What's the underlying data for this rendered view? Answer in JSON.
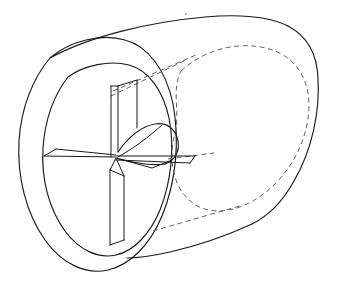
{
  "figure": {
    "title": "Hollow cylinder with internal radial vanes",
    "projection": "oblique",
    "canvas": {
      "width": 345,
      "height": 283,
      "background": "#ffffff"
    },
    "line_styles": {
      "visible_edge": {
        "color": "#1a1a1a",
        "width": 1.15,
        "pattern": "solid"
      },
      "hidden_edge": {
        "color": "#5c5c5c",
        "width": 0.95,
        "pattern": "dashed",
        "dash": "5 3.5"
      }
    },
    "parts": [
      {
        "id": "outer-shell",
        "label": "Cylinder outer shell",
        "visible": true
      },
      {
        "id": "front-face-outer-circle",
        "label": "Front face outer circle",
        "visible": true
      },
      {
        "id": "front-face-inner-circle",
        "label": "Front face inner bore circle",
        "visible": true
      },
      {
        "id": "far-bore-circle",
        "label": "Far end inner bore (hidden)",
        "visible": false
      },
      {
        "id": "vane-upper-vertical",
        "label": "Upper vertical vane",
        "visible": true
      },
      {
        "id": "vane-lower-vertical",
        "label": "Lower vertical vane",
        "visible": true
      },
      {
        "id": "vane-left-horizontal",
        "label": "Left horizontal vane",
        "visible": true
      },
      {
        "id": "vane-right-horizontal",
        "label": "Right horizontal vane",
        "visible": true
      },
      {
        "id": "vane-curved-scoop",
        "label": "Curved scoop vane",
        "visible": true
      },
      {
        "id": "hub",
        "label": "Central hub junction",
        "visible": true
      }
    ],
    "geometry": {
      "front_outer_circle": {
        "cx": 104,
        "cy": 148,
        "rx": 85,
        "ry": 122,
        "rotation": -28
      },
      "front_inner_circle": {
        "cx": 112,
        "cy": 151,
        "rx": 66,
        "ry": 97,
        "rotation": -28
      },
      "far_bore_circle": {
        "cx": 238,
        "cy": 128,
        "rx": 66,
        "ry": 97,
        "rotation": -28
      },
      "hub_point": {
        "x": 116,
        "y": 157
      },
      "axis_direction": {
        "dx": 126,
        "dy": -23
      }
    },
    "artifacts": [
      {
        "id": "dust-speck",
        "x": 186,
        "y": 14,
        "r": 1.1
      }
    ]
  }
}
